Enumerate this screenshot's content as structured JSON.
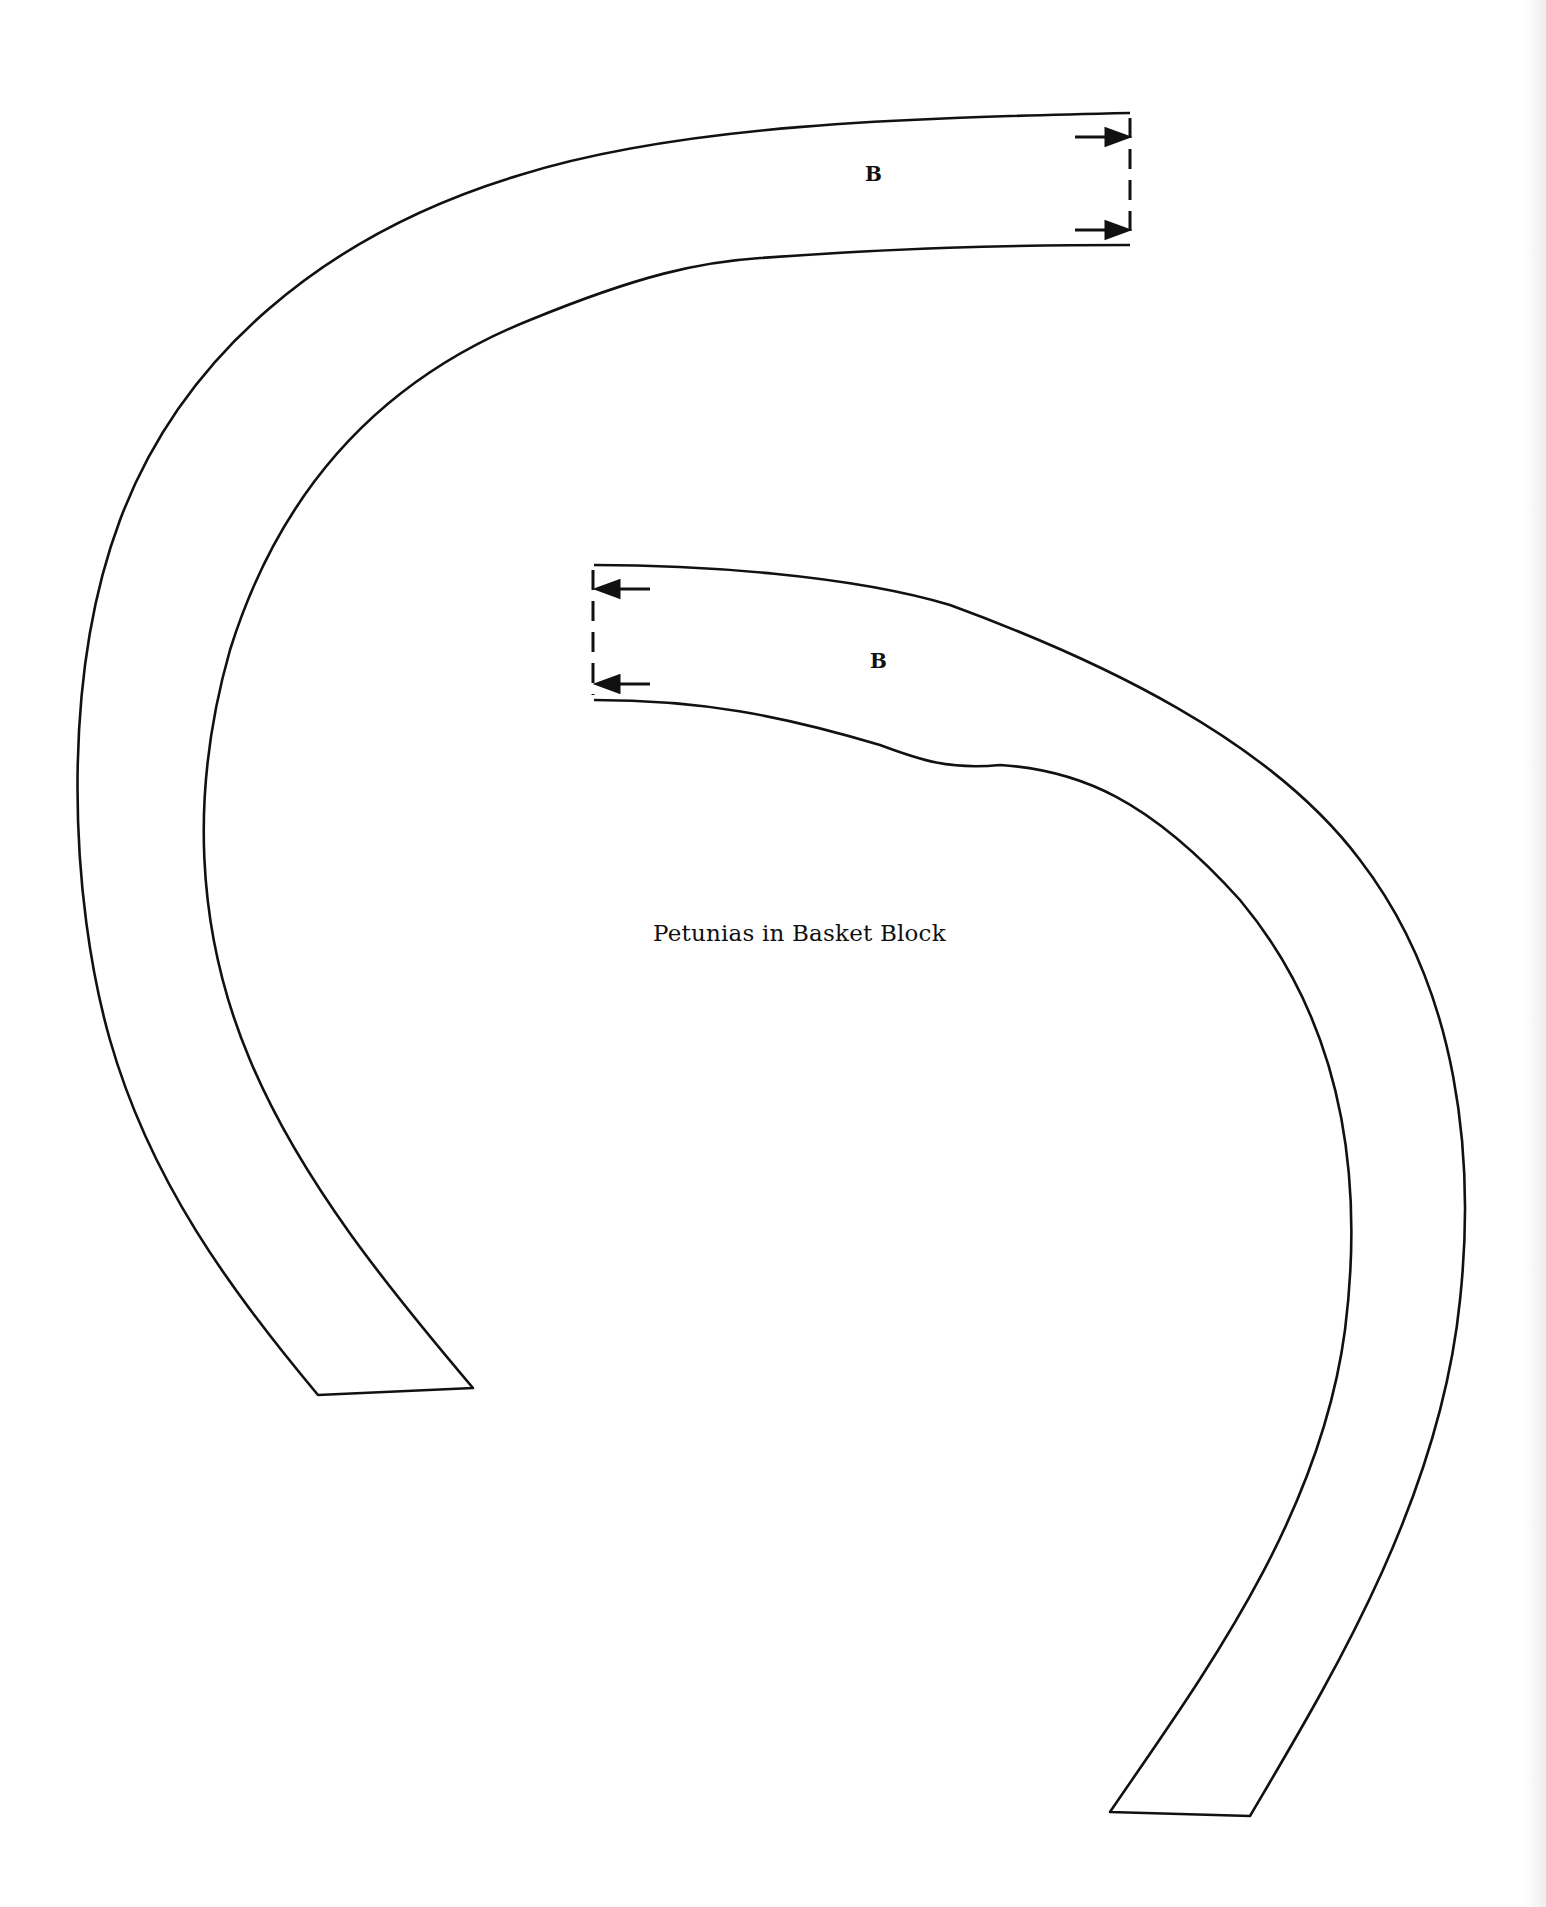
{
  "document": {
    "caption": "Petunias in Basket Block",
    "pieces": [
      {
        "label": "B",
        "position": "upper-left arc"
      },
      {
        "label": "B",
        "position": "lower-right arc"
      }
    ],
    "line_color": "#111111",
    "background": "#ffffff"
  }
}
